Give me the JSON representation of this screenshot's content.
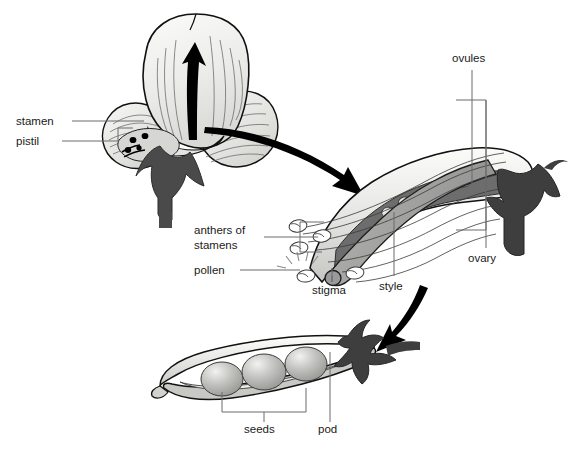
{
  "figure": {
    "background_color": "#ffffff",
    "line_color": "#111111",
    "label_color": "#1a1a1a",
    "leader_color": "#6a6a6a"
  },
  "labels": {
    "stamen": "stamen",
    "pistil": "pistil",
    "anthers_of_stamens_line1": "anthers of",
    "anthers_of_stamens_line2": "stamens",
    "pollen": "pollen",
    "stigma": "stigma",
    "style": "style",
    "ovules": "ovules",
    "ovary": "ovary",
    "seeds": "seeds",
    "pod": "pod"
  },
  "panels": {
    "flower": {
      "name": "pea-flower",
      "parts": [
        "banner petal",
        "wing petals",
        "calyx",
        "stamen",
        "pistil"
      ],
      "petal_fill": "#e8e8e5",
      "calyx_fill": "#4a4a4a",
      "arrow_color": "#000000"
    },
    "pistil": {
      "name": "pistil-detail",
      "parts": [
        "anthers of stamens",
        "pollen",
        "stigma",
        "style",
        "ovules",
        "ovary"
      ],
      "ovary_fill": "#6d6d6d",
      "ovule_fill": "#d9d9d9",
      "style_fill": "#a8a8a8",
      "ovule_count": 5
    },
    "pod": {
      "name": "pea-pod",
      "parts": [
        "seeds",
        "pod"
      ],
      "pod_fill": "#e2e2e0",
      "seed_fill": "#b8b8b8",
      "seed_count": 3,
      "calyx_fill": "#4a4a4a"
    }
  },
  "arrows": [
    {
      "name": "flower-to-pistil",
      "color": "#000000"
    },
    {
      "name": "pistil-to-pod",
      "color": "#000000"
    },
    {
      "name": "flower-banner-up",
      "color": "#000000"
    }
  ]
}
